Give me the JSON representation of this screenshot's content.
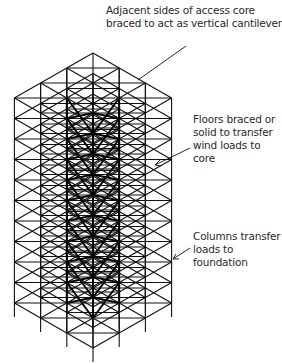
{
  "diagram": {
    "colors": {
      "line": "#111111",
      "core": "#000000",
      "text": "#2a2a2a",
      "background": "#ffffff"
    },
    "structure": {
      "grid_bays": 3,
      "floors": 11,
      "core_position": "center bay"
    },
    "annotations": [
      {
        "id": "core",
        "lines": [
          "Adjacent sides of access core",
          "braced to act as vertical cantilevers"
        ]
      },
      {
        "id": "floors",
        "lines": [
          "Floors braced or",
          "solid to transfer",
          "wind loads to",
          "core"
        ]
      },
      {
        "id": "columns",
        "lines": [
          "Columns transfer",
          "loads to",
          "foundation"
        ]
      }
    ]
  }
}
